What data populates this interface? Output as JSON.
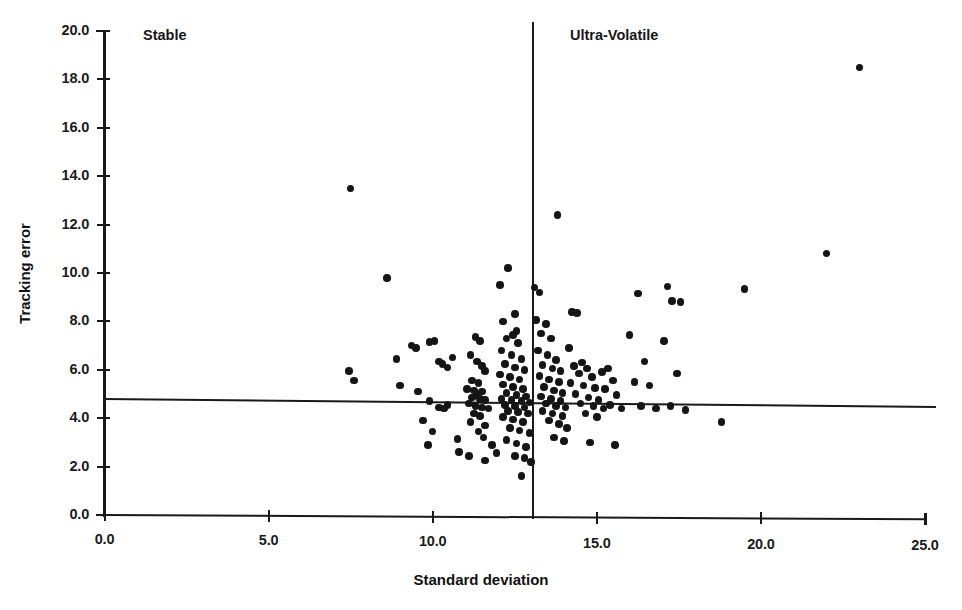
{
  "chart_data": {
    "type": "scatter",
    "title": "",
    "xlabel": "Standard deviation",
    "ylabel": "Tracking error",
    "xlim": [
      0.0,
      25.0
    ],
    "ylim": [
      0.0,
      20.0
    ],
    "xticks": [
      "0.0",
      "5.0",
      "10.0",
      "15.0",
      "20.0",
      "25.0"
    ],
    "xtick_values": [
      0.0,
      5.0,
      10.0,
      15.0,
      20.0,
      25.0
    ],
    "yticks": [
      "0.0",
      "2.0",
      "4.0",
      "6.0",
      "8.0",
      "10.0",
      "12.0",
      "14.0",
      "16.0",
      "18.0",
      "20.0"
    ],
    "ytick_values": [
      0.0,
      2.0,
      4.0,
      6.0,
      8.0,
      10.0,
      12.0,
      14.0,
      16.0,
      18.0,
      20.0
    ],
    "grid": false,
    "legend": "none",
    "marker_color": "#151515",
    "annotations": [
      {
        "name": "quadrant-label-stable",
        "text": "Stable",
        "x": 1.2,
        "y": 19.5
      },
      {
        "name": "quadrant-label-ultra-volatile",
        "text": "Ultra-Volatile",
        "x": 14.2,
        "y": 19.5
      }
    ],
    "reference_lines": [
      {
        "name": "vertical-reference-line",
        "orientation": "vertical",
        "value": 13.05
      },
      {
        "name": "horizontal-reference-line",
        "orientation": "horizontal",
        "value": 4.78
      }
    ],
    "points": [
      [
        7.5,
        13.5
      ],
      [
        8.6,
        9.8
      ],
      [
        7.45,
        5.95
      ],
      [
        7.6,
        5.55
      ],
      [
        8.9,
        6.45
      ],
      [
        9.35,
        7.0
      ],
      [
        9.5,
        6.9
      ],
      [
        9.9,
        7.15
      ],
      [
        10.05,
        7.2
      ],
      [
        9.0,
        5.35
      ],
      [
        9.55,
        5.1
      ],
      [
        10.2,
        6.35
      ],
      [
        10.3,
        6.25
      ],
      [
        10.45,
        6.1
      ],
      [
        10.6,
        6.5
      ],
      [
        9.7,
        3.9
      ],
      [
        10.45,
        4.55
      ],
      [
        10.2,
        4.45
      ],
      [
        10.35,
        4.4
      ],
      [
        9.9,
        4.7
      ],
      [
        10.0,
        3.45
      ],
      [
        9.85,
        2.9
      ],
      [
        10.75,
        3.15
      ],
      [
        10.8,
        2.6
      ],
      [
        11.1,
        2.45
      ],
      [
        11.3,
        7.35
      ],
      [
        11.45,
        7.2
      ],
      [
        11.15,
        6.6
      ],
      [
        11.35,
        6.35
      ],
      [
        11.5,
        6.15
      ],
      [
        11.6,
        5.95
      ],
      [
        11.2,
        5.55
      ],
      [
        11.4,
        5.45
      ],
      [
        11.05,
        5.2
      ],
      [
        11.25,
        5.15
      ],
      [
        11.5,
        5.1
      ],
      [
        11.35,
        4.95
      ],
      [
        11.2,
        4.85
      ],
      [
        11.45,
        4.8
      ],
      [
        11.6,
        4.75
      ],
      [
        11.1,
        4.6
      ],
      [
        11.3,
        4.5
      ],
      [
        11.5,
        4.45
      ],
      [
        11.7,
        4.4
      ],
      [
        11.25,
        4.2
      ],
      [
        11.45,
        4.1
      ],
      [
        11.15,
        3.85
      ],
      [
        11.6,
        3.7
      ],
      [
        11.4,
        3.45
      ],
      [
        11.55,
        3.2
      ],
      [
        11.8,
        2.9
      ],
      [
        11.95,
        2.55
      ],
      [
        11.6,
        2.25
      ],
      [
        12.3,
        10.2
      ],
      [
        12.05,
        9.5
      ],
      [
        12.5,
        8.3
      ],
      [
        12.15,
        8.0
      ],
      [
        12.55,
        7.6
      ],
      [
        12.45,
        7.45
      ],
      [
        12.25,
        7.3
      ],
      [
        12.6,
        7.1
      ],
      [
        12.1,
        6.8
      ],
      [
        12.4,
        6.6
      ],
      [
        12.7,
        6.45
      ],
      [
        12.2,
        6.25
      ],
      [
        12.5,
        6.1
      ],
      [
        12.8,
        6.0
      ],
      [
        12.05,
        5.8
      ],
      [
        12.35,
        5.7
      ],
      [
        12.65,
        5.6
      ],
      [
        12.15,
        5.4
      ],
      [
        12.45,
        5.3
      ],
      [
        12.75,
        5.2
      ],
      [
        12.25,
        5.05
      ],
      [
        12.55,
        4.95
      ],
      [
        12.85,
        4.9
      ],
      [
        12.1,
        4.8
      ],
      [
        12.4,
        4.75
      ],
      [
        12.7,
        4.7
      ],
      [
        12.95,
        4.65
      ],
      [
        12.2,
        4.55
      ],
      [
        12.5,
        4.5
      ],
      [
        12.8,
        4.45
      ],
      [
        12.3,
        4.3
      ],
      [
        12.6,
        4.25
      ],
      [
        12.9,
        4.2
      ],
      [
        12.15,
        4.05
      ],
      [
        12.45,
        3.95
      ],
      [
        12.75,
        3.85
      ],
      [
        12.35,
        3.6
      ],
      [
        12.65,
        3.5
      ],
      [
        12.95,
        3.4
      ],
      [
        12.25,
        3.1
      ],
      [
        12.55,
        2.95
      ],
      [
        12.85,
        2.8
      ],
      [
        12.5,
        2.45
      ],
      [
        12.8,
        2.35
      ],
      [
        13.0,
        2.2
      ],
      [
        12.7,
        1.6
      ],
      [
        13.1,
        9.4
      ],
      [
        13.25,
        9.2
      ],
      [
        13.8,
        12.4
      ],
      [
        13.15,
        8.05
      ],
      [
        13.45,
        7.9
      ],
      [
        13.3,
        7.5
      ],
      [
        13.6,
        7.3
      ],
      [
        13.2,
        6.8
      ],
      [
        13.5,
        6.6
      ],
      [
        13.75,
        6.4
      ],
      [
        13.35,
        6.2
      ],
      [
        13.65,
        6.05
      ],
      [
        13.9,
        5.95
      ],
      [
        13.25,
        5.75
      ],
      [
        13.55,
        5.6
      ],
      [
        13.85,
        5.5
      ],
      [
        13.4,
        5.3
      ],
      [
        13.7,
        5.15
      ],
      [
        13.95,
        5.05
      ],
      [
        13.3,
        4.9
      ],
      [
        13.6,
        4.8
      ],
      [
        13.9,
        4.7
      ],
      [
        13.45,
        4.6
      ],
      [
        13.75,
        4.5
      ],
      [
        14.05,
        4.45
      ],
      [
        13.35,
        4.3
      ],
      [
        13.65,
        4.2
      ],
      [
        13.95,
        4.1
      ],
      [
        13.55,
        3.9
      ],
      [
        13.85,
        3.75
      ],
      [
        14.1,
        3.6
      ],
      [
        13.7,
        3.2
      ],
      [
        14.0,
        3.05
      ],
      [
        14.25,
        8.4
      ],
      [
        14.4,
        8.35
      ],
      [
        14.15,
        6.9
      ],
      [
        14.55,
        6.3
      ],
      [
        14.3,
        6.15
      ],
      [
        14.7,
        6.05
      ],
      [
        14.45,
        5.85
      ],
      [
        14.85,
        5.7
      ],
      [
        14.2,
        5.45
      ],
      [
        14.6,
        5.35
      ],
      [
        14.95,
        5.25
      ],
      [
        14.35,
        5.0
      ],
      [
        14.75,
        4.85
      ],
      [
        15.05,
        4.75
      ],
      [
        14.5,
        4.6
      ],
      [
        14.9,
        4.5
      ],
      [
        15.2,
        4.4
      ],
      [
        14.65,
        4.2
      ],
      [
        15.0,
        4.05
      ],
      [
        14.8,
        3.0
      ],
      [
        15.35,
        6.05
      ],
      [
        15.15,
        5.9
      ],
      [
        15.5,
        5.55
      ],
      [
        15.25,
        5.2
      ],
      [
        15.6,
        4.95
      ],
      [
        15.4,
        4.55
      ],
      [
        15.75,
        4.4
      ],
      [
        15.55,
        2.9
      ],
      [
        16.0,
        7.45
      ],
      [
        16.25,
        9.15
      ],
      [
        16.45,
        6.35
      ],
      [
        16.15,
        5.5
      ],
      [
        16.6,
        5.35
      ],
      [
        16.35,
        4.5
      ],
      [
        16.8,
        4.4
      ],
      [
        17.15,
        9.45
      ],
      [
        17.3,
        8.85
      ],
      [
        17.55,
        8.8
      ],
      [
        17.05,
        7.2
      ],
      [
        17.45,
        5.85
      ],
      [
        17.25,
        4.5
      ],
      [
        17.7,
        4.35
      ],
      [
        18.8,
        3.85
      ],
      [
        19.5,
        9.35
      ],
      [
        22.0,
        10.8
      ],
      [
        23.0,
        18.5
      ]
    ]
  }
}
